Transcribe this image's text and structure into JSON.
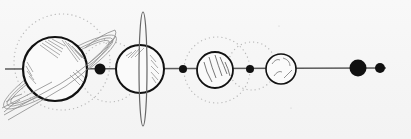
{
  "illustration": {
    "title": "Hand-drawn planets aligned on a line",
    "colors": {
      "background": "#f6f6f6",
      "ink": "#111111",
      "hatch": "#8a8a8a",
      "orbit": "#b5b5b5",
      "line": "#555555"
    },
    "line": {
      "y": 69,
      "x1": 5,
      "x2": 386
    },
    "bodies": [
      {
        "name": "ringed-planet-large",
        "cx": 55,
        "cy": 69,
        "r": 32,
        "ring": "tilted",
        "orbit": {
          "cx": 62,
          "cy": 62,
          "r": 48
        }
      },
      {
        "name": "moon-dot-1",
        "cx": 100,
        "cy": 69,
        "r": 5
      },
      {
        "name": "ringed-planet-vertical",
        "cx": 140,
        "cy": 69,
        "r": 24,
        "ring": "vertical",
        "orbit": {
          "cx": 138,
          "cy": 69,
          "r": 36
        }
      },
      {
        "name": "moon-dot-2",
        "cx": 183,
        "cy": 69,
        "r": 4
      },
      {
        "name": "striped-planet",
        "cx": 215,
        "cy": 70,
        "r": 18,
        "orbit": {
          "cx": 217,
          "cy": 68,
          "r": 32
        }
      },
      {
        "name": "moon-dot-3",
        "cx": 250,
        "cy": 69,
        "r": 4
      },
      {
        "name": "small-planet",
        "cx": 281,
        "cy": 69,
        "r": 15,
        "orbit": {
          "cx": 254,
          "cy": 66,
          "r": 24
        }
      },
      {
        "name": "dark-planet",
        "cx": 358,
        "cy": 68,
        "r": 8
      },
      {
        "name": "moon-dot-4",
        "cx": 380,
        "cy": 68,
        "r": 5
      }
    ]
  }
}
